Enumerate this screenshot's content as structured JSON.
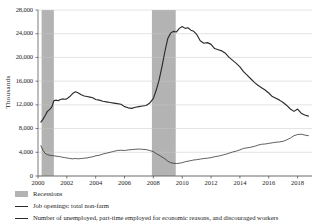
{
  "chart_data": {
    "type": "line",
    "title": "",
    "xlabel": "",
    "ylabel": "Thousands",
    "xlim": [
      2000.0,
      2019.0
    ],
    "ylim": [
      0,
      28000
    ],
    "grid": true,
    "legend_position": "below",
    "ytick_labels": [
      "0",
      "4,000",
      "8,000",
      "12,000",
      "16,000",
      "20,000",
      "24,000",
      "28,000"
    ],
    "ytick_values": [
      0,
      4000,
      8000,
      12000,
      16000,
      20000,
      24000,
      28000
    ],
    "xtick_labels": [
      "2000",
      "2002",
      "2004",
      "2006",
      "2008",
      "2010",
      "2012",
      "2014",
      "2016",
      "2018"
    ],
    "xtick_values": [
      2000,
      2002,
      2004,
      2006,
      2008,
      2010,
      2012,
      2014,
      2016,
      2018
    ],
    "shaded_regions": [
      {
        "name": "Recessions",
        "x0": 2000.25,
        "x1": 2001.1,
        "color": "#b3b3b3"
      },
      {
        "name": "Recessions",
        "x0": 2007.9,
        "x1": 2009.55,
        "color": "#b3b3b3"
      }
    ],
    "series": [
      {
        "name": "Job openings: total non-farm",
        "color": "#2b2b2b",
        "width": "thin",
        "x": [
          2000.2,
          2000.35,
          2000.5,
          2000.65,
          2000.8,
          2000.95,
          2001.1,
          2001.25,
          2001.4,
          2001.55,
          2001.7,
          2001.85,
          2002.0,
          2002.2,
          2002.4,
          2002.6,
          2002.8,
          2003.0,
          2003.2,
          2003.4,
          2003.6,
          2003.8,
          2004.0,
          2004.25,
          2004.5,
          2004.75,
          2005.0,
          2005.25,
          2005.5,
          2005.75,
          2006.0,
          2006.25,
          2006.5,
          2006.75,
          2007.0,
          2007.25,
          2007.5,
          2007.75,
          2008.0,
          2008.2,
          2008.4,
          2008.6,
          2008.8,
          2009.0,
          2009.2,
          2009.4,
          2009.6,
          2009.8,
          2010.0,
          2010.2,
          2010.4,
          2010.6,
          2010.8,
          2011.0,
          2011.25,
          2011.5,
          2011.75,
          2012.0,
          2012.25,
          2012.5,
          2012.75,
          2013.0,
          2013.25,
          2013.5,
          2013.75,
          2014.0,
          2014.25,
          2014.5,
          2014.75,
          2015.0,
          2015.25,
          2015.5,
          2015.75,
          2016.0,
          2016.25,
          2016.5,
          2016.75,
          2017.0,
          2017.25,
          2017.5,
          2017.75,
          2018.0,
          2018.25,
          2018.5,
          2018.75
        ],
        "y": [
          5100,
          4300,
          3800,
          3600,
          3500,
          3450,
          3400,
          3350,
          3300,
          3250,
          3150,
          3100,
          3050,
          2950,
          2900,
          2950,
          2900,
          2950,
          3000,
          3050,
          3150,
          3250,
          3400,
          3500,
          3700,
          3850,
          4000,
          4150,
          4300,
          4350,
          4300,
          4400,
          4450,
          4500,
          4550,
          4500,
          4450,
          4300,
          4100,
          3800,
          3500,
          3200,
          2900,
          2500,
          2250,
          2150,
          2100,
          2150,
          2250,
          2400,
          2500,
          2600,
          2700,
          2750,
          2850,
          2950,
          3000,
          3100,
          3250,
          3350,
          3500,
          3650,
          3850,
          4050,
          4200,
          4400,
          4650,
          4750,
          4850,
          5000,
          5200,
          5350,
          5400,
          5500,
          5600,
          5700,
          5750,
          5850,
          6100,
          6400,
          6800,
          7000,
          7050,
          6900,
          6800
        ]
      },
      {
        "name": "Number of unemployed, part-time employed for economic reasons, and discouraged workers",
        "color": "#2b2b2b",
        "width": "thick",
        "x": [
          2000.2,
          2000.35,
          2000.5,
          2000.65,
          2000.8,
          2000.95,
          2001.1,
          2001.25,
          2001.4,
          2001.55,
          2001.7,
          2001.85,
          2002.0,
          2002.2,
          2002.4,
          2002.6,
          2002.8,
          2003.0,
          2003.2,
          2003.4,
          2003.6,
          2003.8,
          2004.0,
          2004.25,
          2004.5,
          2004.75,
          2005.0,
          2005.25,
          2005.5,
          2005.75,
          2006.0,
          2006.25,
          2006.5,
          2006.75,
          2007.0,
          2007.25,
          2007.5,
          2007.75,
          2008.0,
          2008.2,
          2008.4,
          2008.6,
          2008.8,
          2009.0,
          2009.2,
          2009.4,
          2009.6,
          2009.8,
          2010.0,
          2010.2,
          2010.4,
          2010.6,
          2010.8,
          2011.0,
          2011.25,
          2011.5,
          2011.75,
          2012.0,
          2012.25,
          2012.5,
          2012.75,
          2013.0,
          2013.25,
          2013.5,
          2013.75,
          2014.0,
          2014.25,
          2014.5,
          2014.75,
          2015.0,
          2015.25,
          2015.5,
          2015.75,
          2016.0,
          2016.25,
          2016.5,
          2016.75,
          2017.0,
          2017.25,
          2017.5,
          2017.75,
          2018.0,
          2018.25,
          2018.5,
          2018.75
        ],
        "y": [
          9100,
          9600,
          10200,
          10900,
          11200,
          11600,
          12700,
          12800,
          12700,
          12900,
          13000,
          12950,
          13000,
          13400,
          13900,
          14200,
          14000,
          13700,
          13500,
          13400,
          13300,
          13200,
          12900,
          12800,
          12600,
          12500,
          12400,
          12300,
          12200,
          12100,
          11700,
          11500,
          11400,
          11600,
          11700,
          11800,
          11900,
          12300,
          13100,
          14500,
          16200,
          18500,
          21000,
          23200,
          24100,
          24400,
          24300,
          24900,
          25200,
          24900,
          25000,
          24600,
          24400,
          23900,
          22800,
          22400,
          22500,
          22200,
          21500,
          21300,
          21100,
          20700,
          20000,
          19500,
          19000,
          18400,
          17600,
          17000,
          16400,
          15800,
          15300,
          14900,
          14500,
          14000,
          13400,
          13100,
          12800,
          12400,
          11900,
          11300,
          10900,
          11300,
          10600,
          10300,
          10100
        ]
      }
    ],
    "legend_entries": [
      {
        "label": "Recessions",
        "marker": "swatch",
        "color": "#b3b3b3"
      },
      {
        "label": "Job openings: total non-farm",
        "marker": "line-thin",
        "color": "#2b2b2b"
      },
      {
        "label": "Number of unemployed, part-time employed for economic reasons, and discouraged workers",
        "marker": "line-thick",
        "color": "#2b2b2b"
      }
    ]
  }
}
